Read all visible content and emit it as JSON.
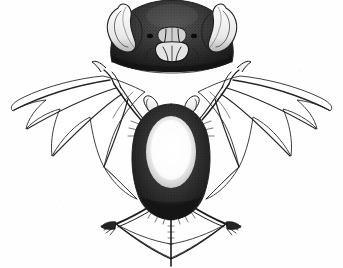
{
  "figure": {
    "kind": "scientific-engraving",
    "orientation": "front view, wings outspread",
    "caption": "",
    "background_color": "#fefefe",
    "ink_color": "#1c1c1c",
    "width": 343,
    "height": 268
  },
  "parts": {
    "head_label": "head detail, front view",
    "ear_left_label": "left ear",
    "ear_right_label": "right ear",
    "noseleaf_label": "nose-leaf",
    "muzzle_label": "muzzle",
    "body_label": "torso",
    "belly_label": "pale ventral patch",
    "wing_left_label": "left wing membrane",
    "wing_right_label": "right wing membrane",
    "thumb_left_label": "left thumb claw",
    "thumb_right_label": "right thumb claw",
    "leg_left_label": "left hind leg",
    "leg_right_label": "right hind leg",
    "foot_left_label": "left foot with claws",
    "foot_right_label": "right foot with claws",
    "uropatagium_label": "tail membrane",
    "tail_label": "tail"
  }
}
